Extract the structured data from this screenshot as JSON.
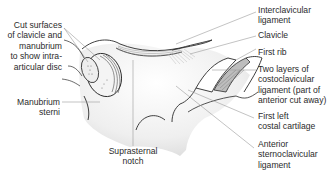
{
  "diagram": {
    "colors": {
      "outline": "#2a2a2a",
      "leader": "#9a9a9a",
      "shade": "#e6e6e6",
      "hatch": "#8c8c8c",
      "label": "#2b2b2b"
    },
    "labels_left": [
      {
        "id": "cut-surfaces",
        "lines": [
          "Cut surfaces",
          "of clavicle and",
          "manubrium",
          "to show intra-",
          "articular disc"
        ]
      },
      {
        "id": "manubrium-sterni",
        "lines": [
          "Manubrium",
          "sterni"
        ]
      }
    ],
    "labels_bottom": [
      {
        "id": "suprasternal-notch",
        "lines": [
          "Suprasternal",
          "notch"
        ]
      }
    ],
    "labels_right": [
      {
        "id": "interclavicular-ligament",
        "lines": [
          "Interclavicular",
          "ligament"
        ]
      },
      {
        "id": "clavicle",
        "lines": [
          "Clavicle"
        ]
      },
      {
        "id": "first-rib",
        "lines": [
          "First rib"
        ]
      },
      {
        "id": "costoclavicular-ligament",
        "lines": [
          "Two layers of",
          "costoclavicular",
          "ligament (part of",
          "anterior cut away)"
        ]
      },
      {
        "id": "first-left-costal-cartilage",
        "lines": [
          "First left",
          "costal cartilage"
        ]
      },
      {
        "id": "anterior-sternoclavicular-ligament",
        "lines": [
          "Anterior",
          "sternoclavicular",
          "ligament"
        ]
      }
    ]
  }
}
